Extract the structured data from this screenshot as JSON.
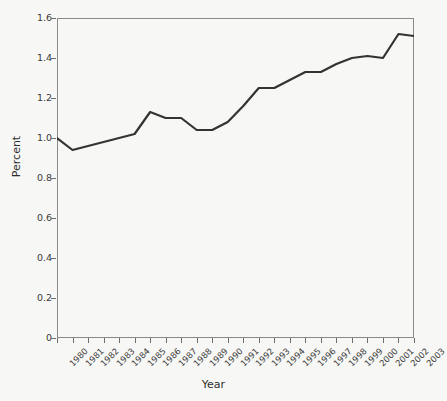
{
  "chart_data": {
    "type": "line",
    "title": "",
    "xlabel": "Year",
    "ylabel": "Percent",
    "categories": [
      "1980",
      "1981",
      "1982",
      "1983",
      "1984",
      "1985",
      "1986",
      "1987",
      "1988",
      "1989",
      "1990",
      "1991",
      "1992",
      "1993",
      "1994",
      "1995",
      "1996",
      "1997",
      "1998",
      "1999",
      "2000",
      "2001",
      "2002",
      "2003"
    ],
    "x": [
      1980,
      1981,
      1982,
      1983,
      1984,
      1985,
      1986,
      1987,
      1988,
      1989,
      1990,
      1991,
      1992,
      1993,
      1994,
      1995,
      1996,
      1997,
      1998,
      1999,
      2000,
      2001,
      2002,
      2003
    ],
    "values": [
      1.0,
      0.94,
      0.96,
      0.98,
      1.0,
      1.02,
      1.13,
      1.1,
      1.1,
      1.04,
      1.04,
      1.08,
      1.16,
      1.25,
      1.25,
      1.29,
      1.33,
      1.33,
      1.37,
      1.4,
      1.41,
      1.4,
      1.52,
      1.51
    ],
    "series": [
      {
        "name": "Percent",
        "values": [
          1.0,
          0.94,
          0.96,
          0.98,
          1.0,
          1.02,
          1.13,
          1.1,
          1.1,
          1.04,
          1.04,
          1.08,
          1.16,
          1.25,
          1.25,
          1.29,
          1.33,
          1.33,
          1.37,
          1.4,
          1.41,
          1.4,
          1.52,
          1.51
        ],
        "color": "#333333"
      }
    ],
    "ylim": [
      0,
      1.6
    ],
    "yticks": [
      0,
      0.2,
      0.4,
      0.6,
      0.8,
      1.0,
      1.2,
      1.4,
      1.6
    ],
    "ytick_labels": [
      "0",
      "0.2",
      "0.4",
      "0.6",
      "0.8",
      "1.0",
      "1.2",
      "1.4",
      "1.6"
    ],
    "xlim": [
      1980,
      2003
    ],
    "grid": false,
    "legend": false,
    "legend_position": "none"
  },
  "axes": {
    "y_title": "Percent",
    "x_title": "Year"
  },
  "colors": {
    "background": "#f7f7f5",
    "line": "#333333",
    "axis": "#8a8a8a",
    "text": "#3a3a3a"
  }
}
